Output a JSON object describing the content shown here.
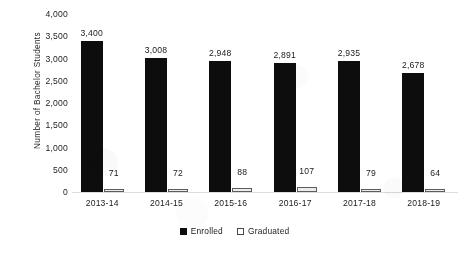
{
  "chart_data": {
    "type": "bar",
    "title": "",
    "xlabel": "",
    "ylabel": "Number of Bachelor Students",
    "categories": [
      "2013-14",
      "2014-15",
      "2015-16",
      "2016-17",
      "2017-18",
      "2018-19"
    ],
    "series": [
      {
        "name": "Enrolled",
        "color": "#111111",
        "values": [
          3400,
          3008,
          2948,
          2891,
          2935,
          2678
        ],
        "labels": [
          "3,400",
          "3,008",
          "2,948",
          "2,891",
          "2,935",
          "2,678"
        ]
      },
      {
        "name": "Graduated",
        "color": "#e8e8e8",
        "values": [
          71,
          72,
          88,
          107,
          79,
          64
        ],
        "labels": [
          "71",
          "72",
          "88",
          "107",
          "79",
          "64"
        ]
      }
    ],
    "ylim": [
      0,
      4000
    ],
    "yticks": [
      0,
      500,
      1000,
      1500,
      2000,
      2500,
      3000,
      3500,
      4000
    ],
    "ytick_labels": [
      "0",
      "500",
      "1,000",
      "1,500",
      "2,000",
      "2,500",
      "3,000",
      "3,500",
      "4,000"
    ],
    "grid": false,
    "legend_position": "bottom"
  },
  "legend": {
    "items": [
      {
        "label": "Enrolled",
        "marker": "filled-square-marker"
      },
      {
        "label": "Graduated",
        "marker": "open-square-marker"
      }
    ]
  }
}
